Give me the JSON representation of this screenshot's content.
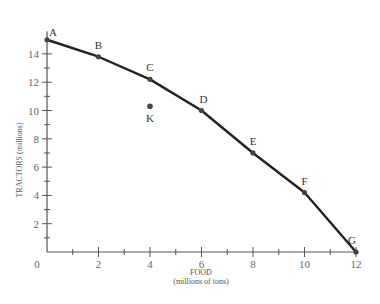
{
  "chart_data": {
    "type": "line",
    "title": "",
    "xlabel": "FOOD",
    "xlabel_sub": "(millions of tons)",
    "ylabel": "TRACTORS (millions)",
    "xlim": [
      0,
      12
    ],
    "ylim": [
      0,
      15
    ],
    "grid": false,
    "x_ticks": [
      "0",
      "2",
      "4",
      "6",
      "8",
      "10",
      "12"
    ],
    "y_ticks": [
      "2",
      "4",
      "6",
      "8",
      "10",
      "12",
      "14"
    ],
    "series": [
      {
        "name": "Production possibilities frontier",
        "points": [
          {
            "label": "A",
            "x": 0,
            "y": 15
          },
          {
            "label": "B",
            "x": 2,
            "y": 13.8
          },
          {
            "label": "C",
            "x": 4,
            "y": 12.2
          },
          {
            "label": "D",
            "x": 6,
            "y": 10
          },
          {
            "label": "E",
            "x": 8,
            "y": 7
          },
          {
            "label": "F",
            "x": 10,
            "y": 4.2
          },
          {
            "label": "G",
            "x": 12,
            "y": 0
          }
        ]
      }
    ],
    "annotations": [
      {
        "label": "K",
        "x": 4,
        "y": 10.3
      }
    ]
  },
  "colors": {
    "line": "#222222",
    "axis": "#555555",
    "point": "#444444"
  }
}
